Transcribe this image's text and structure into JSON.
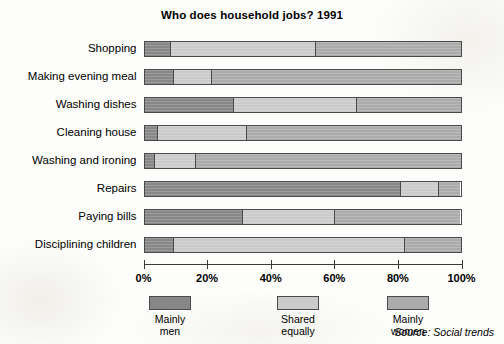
{
  "chart_data": {
    "type": "bar",
    "orientation": "horizontal",
    "stacked": true,
    "normalized_percent": true,
    "title": "Who does household jobs? 1991",
    "xlabel": "",
    "ylabel": "",
    "xlim": [
      0,
      100
    ],
    "xticks": [
      "0%",
      "20%",
      "40%",
      "60%",
      "80%",
      "100%"
    ],
    "xtick_values": [
      0,
      20,
      40,
      60,
      80,
      100
    ],
    "grid": false,
    "legend_position": "bottom",
    "source": "Source: Social trends",
    "categories": [
      "Shopping",
      "Making evening meal",
      "Washing dishes",
      "Cleaning house",
      "Washing and ironing",
      "Repairs",
      "Paying bills",
      "Disciplining children"
    ],
    "series": [
      {
        "name": "Mainly men",
        "color": "#878787",
        "values": [
          8,
          9,
          28,
          4,
          3,
          81,
          31,
          9
        ]
      },
      {
        "name": "Shared equally",
        "color": "#cbcbcb",
        "values": [
          46,
          12,
          39,
          28,
          13,
          12,
          29,
          73
        ]
      },
      {
        "name": "Mainly women",
        "color": "#ababab",
        "values": [
          46,
          79,
          33,
          68,
          84,
          7,
          40,
          18
        ]
      }
    ]
  },
  "legend": {
    "items": [
      {
        "label_line1": "Mainly",
        "label_line2": "men",
        "swatch": "men"
      },
      {
        "label_line1": "Shared",
        "label_line2": "equally",
        "swatch": "shared"
      },
      {
        "label_line1": "Mainly",
        "label_line2": "women",
        "swatch": "women"
      }
    ]
  }
}
